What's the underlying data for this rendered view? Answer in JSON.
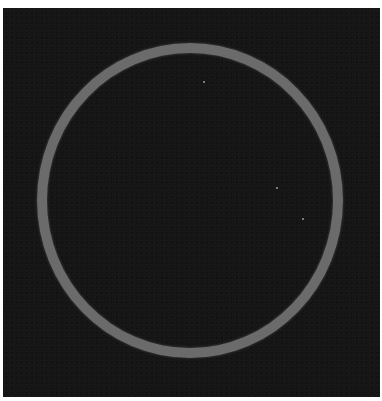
{
  "image": {
    "description": "Dark square field containing a thin gray circular ring",
    "background_color": "#161616",
    "ring_color": "#6b6b6b",
    "frame_color": "#ffffff"
  }
}
